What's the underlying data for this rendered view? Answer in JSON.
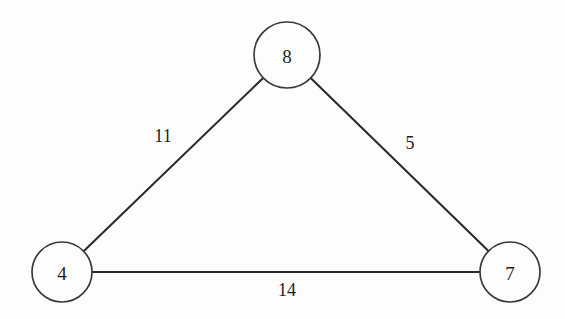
{
  "figure": {
    "background_color": "#fdfdfd",
    "stroke_color": "#2b2b2b",
    "node_stroke_color": "#3a3a3a",
    "text_color": "#1d1d1d"
  },
  "chart_data": {
    "type": "diagram",
    "diagram_kind": "weighted-undirected-graph",
    "title": "",
    "nodes": [
      {
        "id": "n8",
        "label": "8",
        "cx": 287,
        "cy": 55,
        "r": 33
      },
      {
        "id": "n4",
        "label": "4",
        "cx": 62,
        "cy": 272,
        "r": 30
      },
      {
        "id": "n7",
        "label": "7",
        "cx": 510,
        "cy": 272,
        "r": 30
      }
    ],
    "edges": [
      {
        "id": "e-4-8",
        "source": "n4",
        "target": "n8",
        "weight": "11",
        "label_x": 163,
        "label_y": 136
      },
      {
        "id": "e-8-7",
        "source": "n8",
        "target": "n7",
        "weight": "5",
        "label_x": 410,
        "label_y": 143
      },
      {
        "id": "e-4-7",
        "source": "n4",
        "target": "n7",
        "weight": "14",
        "label_x": 287,
        "label_y": 290
      }
    ]
  }
}
